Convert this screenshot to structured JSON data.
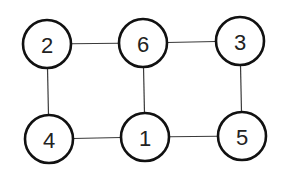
{
  "diagram": {
    "type": "graph",
    "nodes": [
      {
        "id": "2",
        "label": "2",
        "x": 47,
        "y": 44
      },
      {
        "id": "6",
        "label": "6",
        "x": 143,
        "y": 43
      },
      {
        "id": "3",
        "label": "3",
        "x": 240,
        "y": 41
      },
      {
        "id": "4",
        "label": "4",
        "x": 49,
        "y": 139
      },
      {
        "id": "1",
        "label": "1",
        "x": 145,
        "y": 137
      },
      {
        "id": "5",
        "label": "5",
        "x": 242,
        "y": 136
      }
    ],
    "edges": [
      {
        "from": "2",
        "to": "6"
      },
      {
        "from": "6",
        "to": "3"
      },
      {
        "from": "2",
        "to": "4"
      },
      {
        "from": "6",
        "to": "1"
      },
      {
        "from": "3",
        "to": "5"
      },
      {
        "from": "4",
        "to": "1"
      },
      {
        "from": "1",
        "to": "5"
      }
    ],
    "node_radius": 24
  }
}
